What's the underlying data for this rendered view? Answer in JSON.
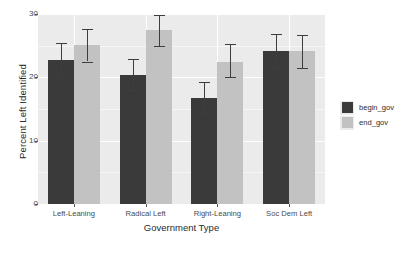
{
  "chart_data": {
    "type": "bar",
    "title": "",
    "subtitle": "",
    "xlabel": "Government Type",
    "ylabel": "Percent Left Identified",
    "categories": [
      "Left-Leaning",
      "Radical Left",
      "Right-Leaning",
      "Soc Dem Left"
    ],
    "ylim": [
      0,
      30
    ],
    "yticks": [
      0,
      10,
      20,
      30
    ],
    "ytick_labels": [
      "0",
      "10",
      "20",
      "30"
    ],
    "grid": true,
    "legend_position": "right",
    "legend_title": "",
    "error_bars": "confidence-interval",
    "series": [
      {
        "name": "begin_gov",
        "color": "#3a3a3a",
        "values": [
          22.8,
          20.4,
          16.7,
          24.1
        ],
        "err_low": [
          20.3,
          18.0,
          14.3,
          21.4
        ],
        "err_high": [
          25.4,
          22.9,
          19.2,
          26.8
        ]
      },
      {
        "name": "end_gov",
        "color": "#c2c2c2",
        "values": [
          25.1,
          27.5,
          22.5,
          24.1
        ],
        "err_low": [
          22.5,
          25.0,
          20.1,
          21.5
        ],
        "err_high": [
          27.7,
          29.9,
          25.2,
          26.7
        ]
      }
    ]
  },
  "legend": {
    "items": [
      {
        "label": "begin_gov",
        "swatch": "begin"
      },
      {
        "label": "end_gov",
        "swatch": "end"
      }
    ]
  },
  "colors": {
    "panel_background": "#ebebeb",
    "gridline": "#ffffff",
    "begin_gov": "#3a3a3a",
    "end_gov": "#c2c2c2",
    "error_bar": "#3d3d3d",
    "text": "#2b2b2b"
  }
}
